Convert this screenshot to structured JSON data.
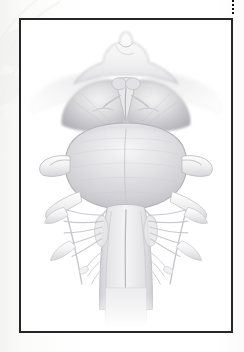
{
  "page": {
    "kind": "anatomical-illustration-plate",
    "background_color": "#ffffff",
    "paper_tone": "#fbfbfa",
    "width": 244,
    "height": 352
  },
  "crop_mark": {
    "style": "dotted",
    "orientation": "vertical",
    "color": "#111111"
  },
  "frame": {
    "border_color": "#262626",
    "border_width_px": 2,
    "fill": "#ffffff"
  },
  "ghost_bleed": {
    "description": "faint show-through of facing-page illustration",
    "color": "#ededea",
    "opacity": 0.5
  },
  "illustration": {
    "title": "",
    "caption": "",
    "subject": "brainstem, ventral (anterior) view",
    "technique": "graphite / airbrush grayscale rendering",
    "palette": {
      "outline": "#b9b9bb",
      "outline_dark": "#9a9a9e",
      "tissue_light": "#f3f3f4",
      "tissue_mid": "#dcdcdf",
      "tissue_shade": "#c4c4c8",
      "tissue_deep": "#adadb2",
      "nerve": "#ececed",
      "nerve_edge": "#c2c2c6",
      "tract": "#e4e4e6"
    },
    "regions": [
      {
        "name": "optic-chiasm-region",
        "label": ""
      },
      {
        "name": "mammillary-bodies",
        "label": ""
      },
      {
        "name": "interpeduncular-fossa",
        "label": ""
      },
      {
        "name": "cerebral-peduncle-left",
        "label": ""
      },
      {
        "name": "cerebral-peduncle-right",
        "label": ""
      },
      {
        "name": "uncus-wing-left",
        "label": ""
      },
      {
        "name": "uncus-wing-right",
        "label": ""
      },
      {
        "name": "pons",
        "label": ""
      },
      {
        "name": "basilar-sulcus",
        "label": ""
      },
      {
        "name": "middle-cerebellar-peduncle-left",
        "label": ""
      },
      {
        "name": "middle-cerebellar-peduncle-right",
        "label": ""
      },
      {
        "name": "trigeminal-nerve-left",
        "label": ""
      },
      {
        "name": "trigeminal-nerve-right",
        "label": ""
      },
      {
        "name": "abducens-nerve-left",
        "label": ""
      },
      {
        "name": "abducens-nerve-right",
        "label": ""
      },
      {
        "name": "facial-vestibulocochlear-left",
        "label": ""
      },
      {
        "name": "facial-vestibulocochlear-right",
        "label": ""
      },
      {
        "name": "medulla-oblongata",
        "label": ""
      },
      {
        "name": "pyramid-left",
        "label": ""
      },
      {
        "name": "pyramid-right",
        "label": ""
      },
      {
        "name": "anterior-median-fissure",
        "label": ""
      },
      {
        "name": "olive-left",
        "label": ""
      },
      {
        "name": "olive-right",
        "label": ""
      },
      {
        "name": "glossopharyngeal-vagus-rootlets-left",
        "label": ""
      },
      {
        "name": "glossopharyngeal-vagus-rootlets-right",
        "label": ""
      },
      {
        "name": "hypoglossal-rootlets-left",
        "label": ""
      },
      {
        "name": "hypoglossal-rootlets-right",
        "label": ""
      },
      {
        "name": "accessory-nerve-left",
        "label": ""
      },
      {
        "name": "accessory-nerve-right",
        "label": ""
      },
      {
        "name": "cervical-spinal-cord",
        "label": ""
      }
    ]
  }
}
